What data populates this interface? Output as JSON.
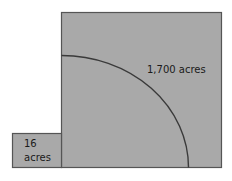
{
  "diagram": {
    "large_area": {
      "label": "1,700 acres"
    },
    "small_area": {
      "label_line1": "16",
      "label_line2": "acres"
    },
    "colors": {
      "fill": "#a9a9a9",
      "stroke": "#555555",
      "arc": "#3a3a3a"
    }
  }
}
